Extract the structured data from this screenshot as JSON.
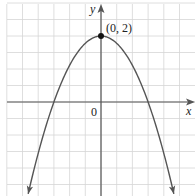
{
  "chart_data": {
    "type": "line",
    "title": "",
    "function": "y = 2 - (8/9)x^2",
    "xlabel": "x",
    "ylabel": "y",
    "origin_label": "0",
    "grid": true,
    "grid_step": 0.5,
    "xlim": [
      -3.0,
      3.0
    ],
    "ylim": [
      -3.0,
      3.0
    ],
    "series": [
      {
        "name": "parabola",
        "x": [
          -2.32,
          -2.0,
          -1.5,
          -1.0,
          -0.5,
          0,
          0.5,
          1.0,
          1.5,
          2.0,
          2.32
        ],
        "y": [
          -2.78,
          -1.56,
          0.0,
          1.11,
          1.78,
          2.0,
          1.78,
          1.11,
          0.0,
          -1.56,
          -2.78
        ]
      }
    ],
    "annotations": [
      {
        "text": "(0, 2)",
        "x": 0,
        "y": 2,
        "marker": "filled-dot"
      }
    ],
    "x_intercepts": [
      -1.5,
      1.5
    ],
    "y_intercept": 2,
    "arrows": [
      "curve-ends-down",
      "x-axis-positive",
      "y-axis-positive"
    ]
  },
  "labels": {
    "x_axis": "x",
    "y_axis": "y",
    "origin": "0",
    "vertex": "(0, 2)"
  },
  "colors": {
    "grid": "#d6d6d6",
    "axis": "#555555",
    "curve": "#555555",
    "point": "#111111"
  }
}
